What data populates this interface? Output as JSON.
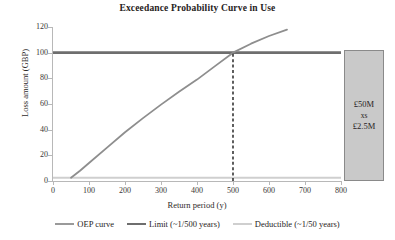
{
  "chart_data": {
    "type": "line",
    "title": "Exceedance Probability Curve in Use",
    "xlabel": "Return period (y)",
    "ylabel": "Loss amount (GBP)",
    "xlim": [
      0,
      800
    ],
    "ylim": [
      0,
      120
    ],
    "xticks": [
      0,
      100,
      200,
      300,
      400,
      500,
      600,
      700,
      800
    ],
    "yticks": [
      0,
      20,
      40,
      60,
      80,
      100,
      120
    ],
    "grid": false,
    "legend_position": "bottom",
    "series": [
      {
        "name": "OEP curve",
        "type": "line",
        "color": "#8e8e8e",
        "x": [
          50,
          75,
          100,
          150,
          200,
          250,
          300,
          350,
          400,
          450,
          500,
          550,
          600,
          650
        ],
        "y": [
          2.5,
          8,
          14,
          26,
          38,
          49,
          59.5,
          69.5,
          79,
          89.5,
          100,
          107,
          113,
          118
        ]
      },
      {
        "name": "Limit (~1/500 years)",
        "type": "hline",
        "color": "#6e6e6e",
        "y": 100,
        "x_start": 0,
        "x_end": 800
      },
      {
        "name": "Deductible (~1/50 years)",
        "type": "hline",
        "color": "#cfcfcf",
        "y": 2.5,
        "x_start": 0,
        "x_end": 800
      }
    ],
    "annotations": [
      {
        "name": "limit-crossing-dashed-line",
        "type": "vline-dashed",
        "x": 500,
        "y_start": 0,
        "y_end": 100,
        "color": "#1a1a1a"
      },
      {
        "name": "layer-box",
        "type": "box",
        "x_start": 810,
        "x_end": 920,
        "y_start": 0,
        "y_end": 102,
        "fill": "#c9c9c9",
        "border": "#8a8a8a",
        "lines": [
          "£50M",
          "xs",
          "£2.5M"
        ]
      }
    ],
    "legend": [
      {
        "label": "OEP curve",
        "color": "#9a9a9a"
      },
      {
        "label": "Limit (~1/500 years)",
        "color": "#6e6e6e"
      },
      {
        "label": "Deductible (~1/50 years)",
        "color": "#cfcfcf"
      }
    ]
  },
  "layer_box": {
    "top_line": "£50M",
    "mid_line": "xs",
    "bottom_line": "£2.5M"
  },
  "colors": {
    "oep": "#8e8e8e",
    "limit": "#6e6e6e",
    "deductible": "#cfcfcf",
    "dashed": "#1a1a1a",
    "axis": "#b8b8b8",
    "box_fill": "#c9c9c9",
    "box_border": "#8a8a8a",
    "text": "#231f20"
  }
}
